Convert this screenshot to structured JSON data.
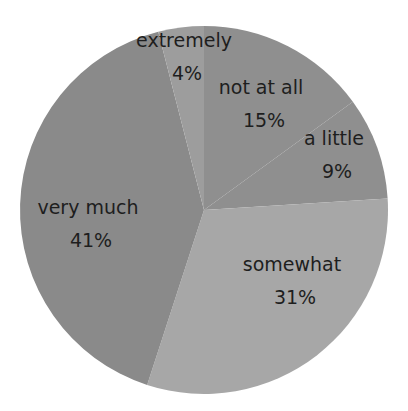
{
  "chart_data": {
    "type": "pie",
    "title": "",
    "categories": [
      "not at all",
      "a little",
      "somewhat",
      "very much",
      "extremely"
    ],
    "values": [
      15,
      9,
      31,
      41,
      4
    ],
    "unit": "%",
    "start_angle_deg": 0,
    "direction": "clockwise",
    "legend": "none",
    "data_labels": [
      {
        "name": "not at all",
        "pct": "15%",
        "x": 264,
        "y": 94
      },
      {
        "name": "a little",
        "pct": "9%",
        "x": 337,
        "y": 145
      },
      {
        "name": "somewhat",
        "pct": "31%",
        "x": 295,
        "y": 271
      },
      {
        "name": "very much",
        "pct": "41%",
        "x": 91,
        "y": 214
      },
      {
        "name": "extremely",
        "pct": "4%",
        "x": 187,
        "y": 47
      }
    ],
    "colors": [
      "#8f8f8f",
      "#8f8f8f",
      "#a7a7a7",
      "#8a8a8a",
      "#9d9d9d"
    ]
  },
  "geometry": {
    "cx": 204,
    "cy": 210,
    "r": 184
  }
}
